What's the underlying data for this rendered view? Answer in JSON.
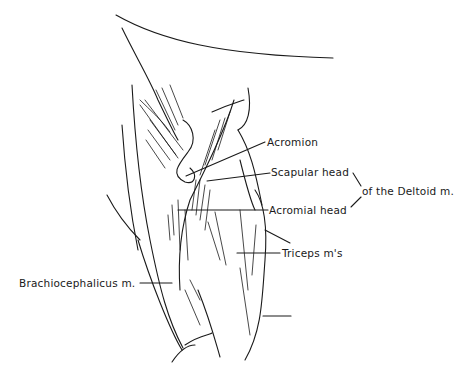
{
  "figure": {
    "type": "anatomical line drawing",
    "labels": {
      "acromion": "Acromion",
      "scapular_head": "Scapular head",
      "acromial_head": "Acromial head",
      "deltoid_group": "of the Deltoid m.",
      "triceps": "Triceps m's",
      "brachiocephalicus": "Brachiocephalicus m."
    },
    "colors": {
      "ink": "#1a1a1a",
      "background": "#ffffff"
    }
  }
}
